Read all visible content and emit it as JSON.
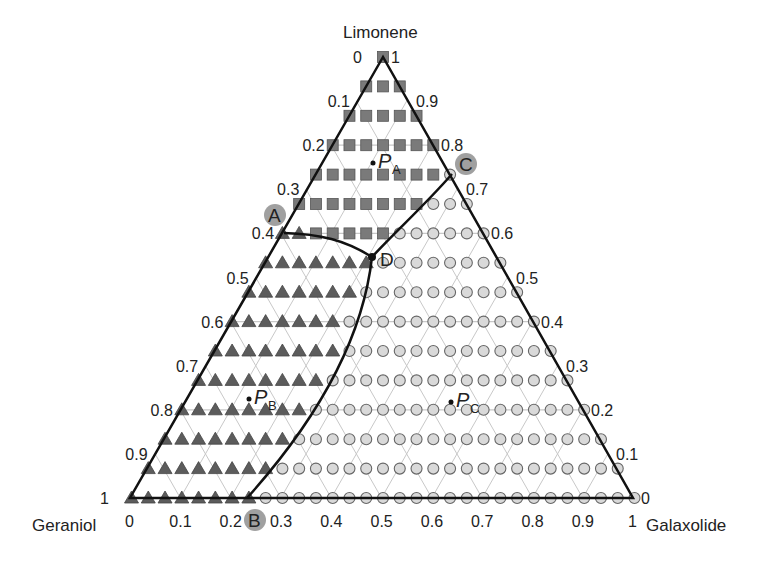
{
  "diagram": {
    "type": "ternary",
    "vertices": {
      "top": "Limonene",
      "left": "Geraniol",
      "right": "Galaxolide"
    },
    "colors": {
      "square": "#7a7a7a",
      "triangle": "#5c5c5c",
      "circle": "#d9d9d9",
      "grid": "#c8c8c8",
      "boundary": "#111111",
      "highlight": "#8f8f8f"
    },
    "left_ticks": [
      "0",
      "0.1",
      "0.2",
      "0.3",
      "0.4",
      "0.5",
      "0.6",
      "0.7",
      "0.8",
      "0.9",
      "1"
    ],
    "right_ticks": [
      "1",
      "0.9",
      "0.8",
      "0.7",
      "0.6",
      "0.5",
      "0.4",
      "0.3",
      "0.2",
      "0.1",
      "0"
    ],
    "bottom_ticks": [
      "0",
      "0.1",
      "0.2",
      "0.3",
      "0.4",
      "0.5",
      "0.6",
      "0.7",
      "0.8",
      "0.9",
      "1"
    ],
    "points": {
      "PA": {
        "label": "P",
        "sub": "A"
      },
      "PB": {
        "label": "P",
        "sub": "B"
      },
      "PC": {
        "label": "P",
        "sub": "C"
      }
    },
    "corners": {
      "A": "A",
      "B": "B",
      "C": "C",
      "D": "D"
    },
    "rows": [
      "S",
      "SSS",
      "SSSSS",
      "SSSSSSS",
      "SSSSSSSSO",
      "SSSSSSSSOOO",
      "TTSSSSSOOOOOO",
      "TTTTTTTOOOOOOOO",
      "TTTTTTTOOOOOOOOOO",
      "TTTTTTTOOOOOOOOOOOO",
      "TTTTTTTTOOOOOOOOOOOOO",
      "TTTTTTTTOOOOOOOOOOOOOOO",
      "TTTTTTTTOOOOOOOOOOOOOOOOO",
      "TTTTTTTTOOOOOOOOOOOOOOOOOOO",
      "TTTTTTTTOOOOOOOOOOOOOOOOOOOOO",
      "TTTTTTTTOOOOOOOOOOOOOOOOOOOOOOO"
    ],
    "legend_key": {
      "S": "square",
      "T": "triangle",
      "O": "circle"
    }
  }
}
